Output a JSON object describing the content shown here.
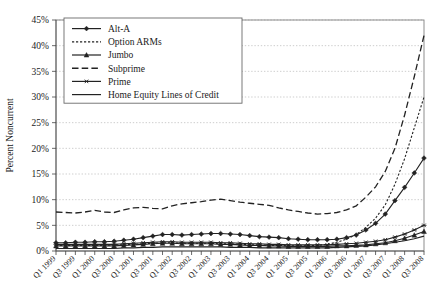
{
  "chart_data": {
    "type": "line",
    "title": "",
    "xlabel": "",
    "ylabel": "Percent Noncurrent",
    "ylim": [
      0,
      45
    ],
    "ytick_values": [
      0,
      5,
      10,
      15,
      20,
      25,
      30,
      35,
      40,
      45
    ],
    "ytick_labels": [
      "0%",
      "5%",
      "10%",
      "15%",
      "20%",
      "25%",
      "30%",
      "35%",
      "40%",
      "45%"
    ],
    "grid": true,
    "legend_position": "top-left",
    "x": [
      "Q1 1999",
      "Q2 1999",
      "Q3 1999",
      "Q4 1999",
      "Q1 2000",
      "Q2 2000",
      "Q3 2000",
      "Q4 2000",
      "Q1 2001",
      "Q2 2001",
      "Q3 2001",
      "Q4 2001",
      "Q1 2002",
      "Q2 2002",
      "Q3 2002",
      "Q4 2002",
      "Q1 2003",
      "Q2 2003",
      "Q3 2003",
      "Q4 2003",
      "Q1 2004",
      "Q2 2004",
      "Q3 2004",
      "Q4 2004",
      "Q1 2005",
      "Q2 2005",
      "Q3 2005",
      "Q4 2005",
      "Q1 2006",
      "Q2 2006",
      "Q3 2006",
      "Q4 2006",
      "Q1 2007",
      "Q2 2007",
      "Q3 2007",
      "Q4 2007",
      "Q1 2008",
      "Q2 2008",
      "Q3 2008"
    ],
    "xtick_labels_shown": [
      "Q1 1999",
      "Q3 1999",
      "Q1 2000",
      "Q3 2000",
      "Q1 2001",
      "Q3 2001",
      "Q1 2002",
      "Q3 2002",
      "Q1 2003",
      "Q3 2003",
      "Q1 2004",
      "Q3 2004",
      "Q1 2005",
      "Q3 2005",
      "Q1 2006",
      "Q3 2006",
      "Q1 2007",
      "Q3 2007",
      "Q1 2008",
      "Q3 2008"
    ],
    "series": [
      {
        "name": "Alt-A",
        "style": "solid-marker",
        "marker": "diamond",
        "color": "#222222",
        "values": [
          1.6,
          1.6,
          1.7,
          1.7,
          1.8,
          1.8,
          1.9,
          2.1,
          2.3,
          2.6,
          2.9,
          3.2,
          3.2,
          3.1,
          3.2,
          3.3,
          3.4,
          3.4,
          3.3,
          3.2,
          3.0,
          2.8,
          2.7,
          2.6,
          2.4,
          2.3,
          2.2,
          2.2,
          2.2,
          2.3,
          2.6,
          3.1,
          4.1,
          5.4,
          7.2,
          9.8,
          12.4,
          15.2,
          18.1
        ]
      },
      {
        "name": "Option ARMs",
        "style": "dotted",
        "marker": "none",
        "color": "#222222",
        "values": [
          1.1,
          1.1,
          1.1,
          1.1,
          1.1,
          1.1,
          1.2,
          1.2,
          1.3,
          1.4,
          1.5,
          1.6,
          1.6,
          1.5,
          1.5,
          1.5,
          1.5,
          1.4,
          1.4,
          1.3,
          1.2,
          1.2,
          1.1,
          1.1,
          1.0,
          1.0,
          1.0,
          1.1,
          1.3,
          1.7,
          2.3,
          3.2,
          4.6,
          6.4,
          9.0,
          13.0,
          18.0,
          24.0,
          30.0
        ]
      },
      {
        "name": "Jumbo",
        "style": "solid-marker",
        "marker": "triangle",
        "color": "#222222",
        "values": [
          1.0,
          1.0,
          1.0,
          1.0,
          1.0,
          1.0,
          1.0,
          1.1,
          1.2,
          1.3,
          1.4,
          1.5,
          1.5,
          1.4,
          1.4,
          1.4,
          1.4,
          1.3,
          1.3,
          1.2,
          1.1,
          1.1,
          1.0,
          1.0,
          0.9,
          0.9,
          0.9,
          0.9,
          0.9,
          1.0,
          1.0,
          1.1,
          1.2,
          1.4,
          1.6,
          2.0,
          2.5,
          3.1,
          3.8
        ]
      },
      {
        "name": "Subprime",
        "style": "longdash",
        "marker": "none",
        "color": "#222222",
        "values": [
          7.6,
          7.5,
          7.4,
          7.6,
          7.9,
          7.6,
          7.5,
          8.0,
          8.4,
          8.5,
          8.3,
          8.2,
          8.8,
          9.2,
          9.4,
          9.6,
          9.9,
          10.1,
          9.8,
          9.5,
          9.3,
          9.1,
          8.9,
          8.4,
          8.0,
          7.7,
          7.4,
          7.2,
          7.3,
          7.5,
          8.0,
          8.8,
          10.5,
          12.5,
          15.5,
          20.0,
          26.5,
          34.0,
          42.0
        ]
      },
      {
        "name": "Prime",
        "style": "solid-marker",
        "marker": "asterisk",
        "color": "#222222",
        "values": [
          1.3,
          1.3,
          1.3,
          1.3,
          1.3,
          1.3,
          1.3,
          1.4,
          1.5,
          1.6,
          1.7,
          1.8,
          1.8,
          1.7,
          1.7,
          1.7,
          1.7,
          1.6,
          1.6,
          1.5,
          1.4,
          1.4,
          1.3,
          1.3,
          1.2,
          1.2,
          1.2,
          1.2,
          1.2,
          1.3,
          1.4,
          1.5,
          1.7,
          1.9,
          2.2,
          2.7,
          3.3,
          4.1,
          5.0
        ]
      },
      {
        "name": "Home Equity Lines of Credit",
        "style": "solid",
        "marker": "none",
        "color": "#222222",
        "values": [
          0.5,
          0.5,
          0.5,
          0.5,
          0.5,
          0.5,
          0.5,
          0.6,
          0.6,
          0.7,
          0.7,
          0.8,
          0.8,
          0.8,
          0.8,
          0.8,
          0.8,
          0.8,
          0.7,
          0.7,
          0.7,
          0.6,
          0.6,
          0.6,
          0.6,
          0.6,
          0.6,
          0.6,
          0.6,
          0.7,
          0.8,
          0.9,
          1.0,
          1.2,
          1.4,
          1.7,
          2.0,
          2.4,
          2.9
        ]
      }
    ]
  }
}
